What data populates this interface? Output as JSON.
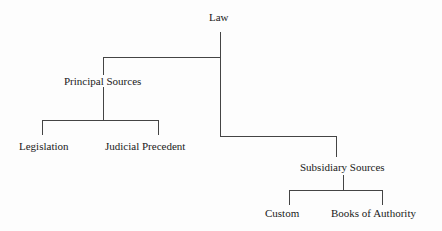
{
  "diagram": {
    "type": "tree",
    "root": "Law",
    "nodes": {
      "law": "Law",
      "principal": "Principal Sources",
      "legislation": "Legislation",
      "precedent": "Judicial Precedent",
      "subsidiary": "Subsidiary Sources",
      "custom": "Custom",
      "books": "Books of Authority"
    },
    "edges": [
      [
        "Law",
        "Principal Sources"
      ],
      [
        "Law",
        "Subsidiary Sources"
      ],
      [
        "Principal Sources",
        "Legislation"
      ],
      [
        "Principal Sources",
        "Judicial Precedent"
      ],
      [
        "Subsidiary Sources",
        "Custom"
      ],
      [
        "Subsidiary Sources",
        "Books of Authority"
      ]
    ],
    "line_color": "#444444"
  }
}
